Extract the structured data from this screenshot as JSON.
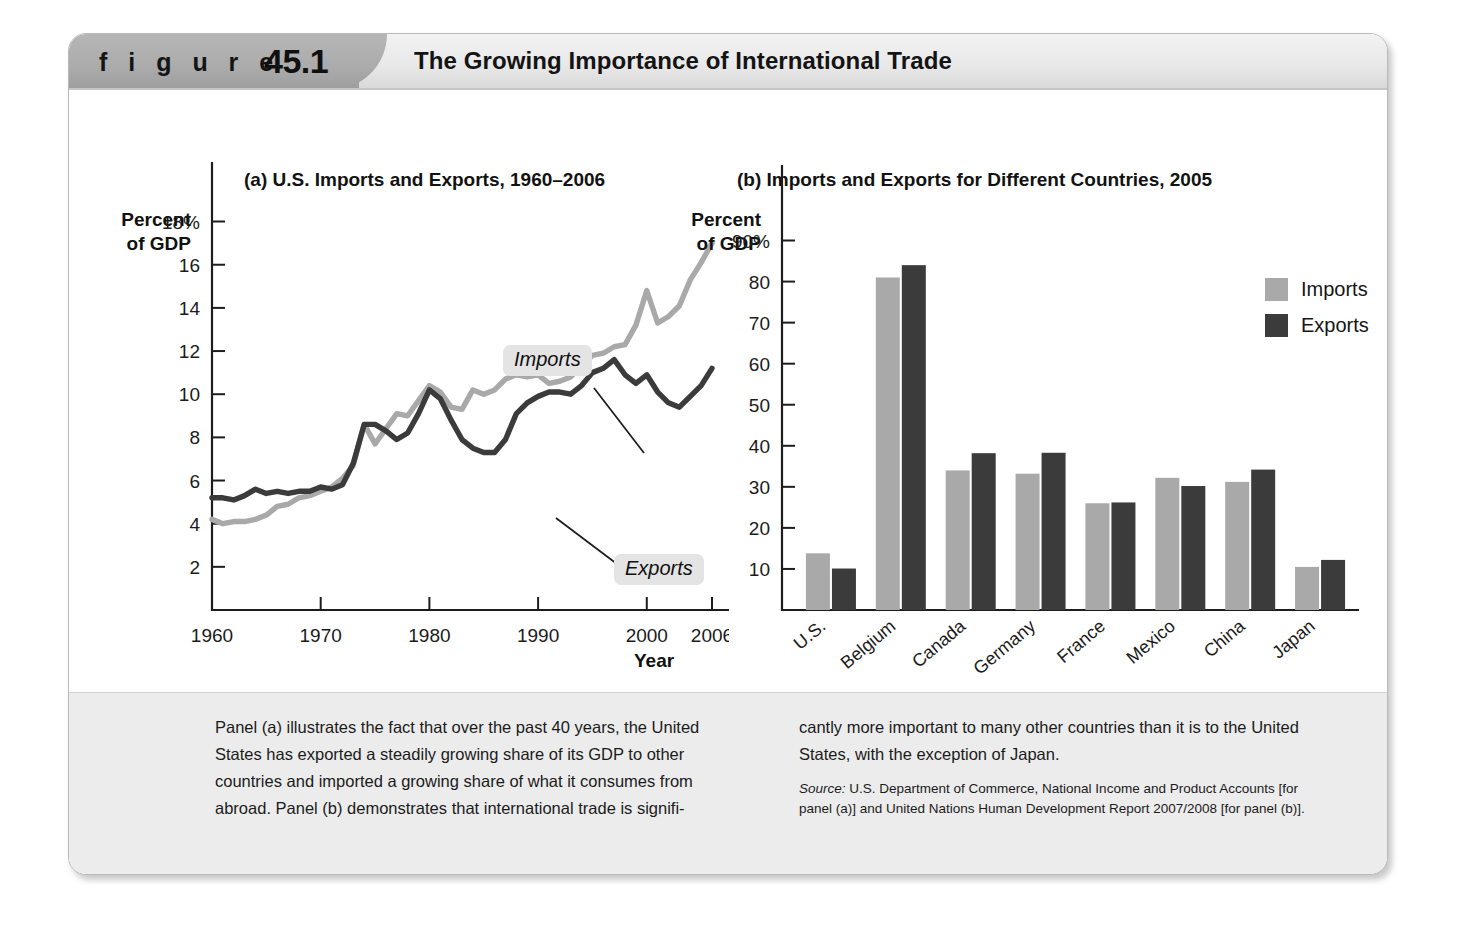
{
  "figure": {
    "label_word": "f i g u r e",
    "number": "45.1",
    "title": "The Growing Importance of International Trade"
  },
  "colors": {
    "imports": "#a9a9a9",
    "exports": "#3b3b3b",
    "axis": "#1d1d1d",
    "caption_band": "#ececec",
    "header_tab": "#ababab"
  },
  "panel_a": {
    "title": "(a) U.S. Imports and Exports, 1960–2006",
    "axis_head_line1": "Percent",
    "axis_head_line2": "of GDP",
    "x_axis_label": "Year",
    "annotation_imports": "Imports",
    "annotation_exports": "Exports"
  },
  "panel_b": {
    "title": "(b) Imports and Exports for Different Countries, 2005",
    "axis_head_line1": "Percent",
    "axis_head_line2": "of GDP",
    "legend": [
      {
        "label": "Imports",
        "color": "#a9a9a9"
      },
      {
        "label": "Exports",
        "color": "#3b3b3b"
      }
    ]
  },
  "caption": {
    "left": "Panel (a) illustrates the fact that over the past 40 years, the United States has exported a steadily growing share of its GDP to other countries and imported a growing share of what it consumes from abroad. Panel (b) demonstrates that international trade is signifi-",
    "right": "cantly more important to many other countries than it is to the United States, with the exception of Japan.",
    "source_prefix": "Source:",
    "source_text": " U.S. Department of Commerce, National Income and Product Accounts [for panel (a)] and United Nations Human Development Report 2007/2008 [for panel (b)]."
  },
  "chart_data": [
    {
      "type": "line",
      "panel": "a",
      "title": "(a) U.S. Imports and Exports, 1960–2006",
      "xlabel": "Year",
      "ylabel": "Percent of GDP",
      "grid": false,
      "legend": "annotated-inline",
      "xlim": [
        1960,
        2006
      ],
      "ylim": [
        0,
        19
      ],
      "xticks": [
        1960,
        1970,
        1980,
        1990,
        2000,
        2006
      ],
      "xtick_labels": [
        "1960",
        "1970",
        "1980",
        "1990",
        "2000",
        "2006"
      ],
      "yticks": [
        2,
        4,
        6,
        8,
        10,
        12,
        14,
        16,
        18
      ],
      "ytick_labels": [
        "2",
        "4",
        "6",
        "8",
        "10",
        "12",
        "14",
        "16",
        "18%"
      ],
      "x": [
        1960,
        1961,
        1962,
        1963,
        1964,
        1965,
        1966,
        1967,
        1968,
        1969,
        1970,
        1971,
        1972,
        1973,
        1974,
        1975,
        1976,
        1977,
        1978,
        1979,
        1980,
        1981,
        1982,
        1983,
        1984,
        1985,
        1986,
        1987,
        1988,
        1989,
        1990,
        1991,
        1992,
        1993,
        1994,
        1995,
        1996,
        1997,
        1998,
        1999,
        2000,
        2001,
        2002,
        2003,
        2004,
        2005,
        2006
      ],
      "series": [
        {
          "name": "Imports",
          "color": "#a9a9a9",
          "values": [
            4.2,
            4.0,
            4.1,
            4.1,
            4.2,
            4.4,
            4.8,
            4.9,
            5.2,
            5.3,
            5.5,
            5.7,
            6.1,
            6.7,
            8.6,
            7.7,
            8.4,
            9.1,
            9.0,
            9.7,
            10.4,
            10.1,
            9.4,
            9.3,
            10.2,
            10.0,
            10.2,
            10.7,
            10.9,
            10.8,
            10.9,
            10.5,
            10.6,
            10.8,
            11.3,
            11.8,
            11.9,
            12.2,
            12.3,
            13.2,
            14.8,
            13.3,
            13.6,
            14.1,
            15.3,
            16.1,
            17.0
          ]
        },
        {
          "name": "Exports",
          "color": "#3b3b3b",
          "values": [
            5.2,
            5.2,
            5.1,
            5.3,
            5.6,
            5.4,
            5.5,
            5.4,
            5.5,
            5.5,
            5.7,
            5.6,
            5.8,
            6.8,
            8.6,
            8.6,
            8.3,
            7.9,
            8.2,
            9.1,
            10.2,
            9.8,
            8.8,
            7.9,
            7.5,
            7.3,
            7.3,
            7.9,
            9.1,
            9.6,
            9.9,
            10.1,
            10.1,
            10.0,
            10.4,
            11.0,
            11.2,
            11.6,
            10.9,
            10.5,
            10.9,
            10.1,
            9.6,
            9.4,
            9.9,
            10.4,
            11.2
          ]
        }
      ]
    },
    {
      "type": "bar",
      "panel": "b",
      "title": "(b) Imports and Exports for Different Countries, 2005",
      "xlabel": "",
      "ylabel": "Percent of GDP",
      "grid": false,
      "legend": "top-right",
      "ylim": [
        0,
        95
      ],
      "yticks": [
        10,
        20,
        30,
        40,
        50,
        60,
        70,
        80,
        90
      ],
      "ytick_labels": [
        "10",
        "20",
        "30",
        "40",
        "50",
        "60",
        "70",
        "80",
        "90%"
      ],
      "categories": [
        "U.S.",
        "Belgium",
        "Canada",
        "Germany",
        "France",
        "Mexico",
        "China",
        "Japan"
      ],
      "series": [
        {
          "name": "Imports",
          "color": "#a9a9a9",
          "values": [
            13.8,
            81,
            34,
            33.2,
            26,
            32.2,
            31.2,
            10.5
          ]
        },
        {
          "name": "Exports",
          "color": "#3b3b3b",
          "values": [
            10.1,
            84,
            38.2,
            38.3,
            26.2,
            30.2,
            34.2,
            12.2
          ]
        }
      ]
    }
  ]
}
